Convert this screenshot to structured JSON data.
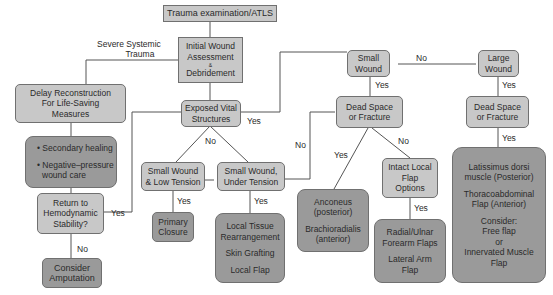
{
  "nodes": {
    "atls": "Trauma examination/ATLS",
    "initial": [
      "Initial Wound",
      "Assessment",
      "&",
      "Debridement"
    ],
    "delay": [
      "Delay Reconstruction",
      "For Life-Saving",
      "Measures"
    ],
    "secondary": [
      "• Secondary healing",
      "• Negative–pressure",
      "wound care"
    ],
    "return": [
      "Return to",
      "Hemodynamic",
      "Stability?"
    ],
    "amputation": [
      "Consider",
      "Amputation"
    ],
    "exposed": [
      "Exposed Vital",
      "Structures"
    ],
    "small_low": [
      "Small Wound",
      "& Low Tension"
    ],
    "small_under": [
      "Small Wound,",
      "Under Tension"
    ],
    "primary": [
      "Primary",
      "Closure"
    ],
    "local": [
      "Local Tissue",
      "Rearrangement",
      "Skin Grafting",
      "Local Flap"
    ],
    "small_wound": [
      "Small",
      "Wound"
    ],
    "large_wound": [
      "Large",
      "Wound"
    ],
    "dead1": [
      "Dead Space",
      "or Fracture"
    ],
    "dead2": [
      "Dead Space",
      "or Fracture"
    ],
    "anconeus": [
      "Anconeus",
      "(posterior)",
      "Brachioradialis",
      "(anterior)"
    ],
    "intact": [
      "Intact Local",
      "Flap",
      "Options"
    ],
    "radial": [
      "Radial/Ulnar",
      "Forearm Flaps",
      "Lateral Arm",
      "Flap"
    ],
    "latissimus": [
      "Latissimus dorsi",
      "muscle (Posterior)",
      "Thoracoabdominal",
      "Flap (Anterior)",
      "Consider:",
      "Free flap",
      "or",
      "Innervated Muscle",
      "Flap"
    ]
  },
  "edge_labels": {
    "severe": [
      "Severe Systemic",
      "Trauma"
    ],
    "exposed_yes": "Yes",
    "exposed_no": "No",
    "return_yes": "Yes",
    "return_no": "No",
    "low_yes": "Yes",
    "under_yes": "Yes",
    "under_no": "No",
    "small_no": "No",
    "small_yes": "Yes",
    "large_yes": "Yes",
    "dead1_yes": "Yes",
    "dead1_no": "No",
    "intact_yes": "Yes",
    "dead2_yes": "Yes"
  }
}
